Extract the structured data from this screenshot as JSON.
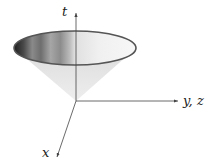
{
  "diagram": {
    "type": "light-cone",
    "axes": {
      "t": {
        "label": "t"
      },
      "yz": {
        "label": "y, z"
      },
      "x": {
        "label": "x"
      }
    },
    "colors": {
      "cone_body": "#e6e6e6",
      "rim": "#555555",
      "axis": "#444444",
      "inner_dark": "#1e1e1e",
      "inner_light": "#f4f4f4"
    }
  }
}
